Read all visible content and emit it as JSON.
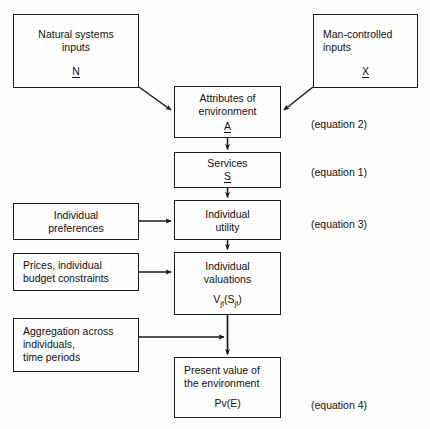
{
  "diagram": {
    "background_color": "#fdfdfd",
    "line_color": "#1a1a1a",
    "text_color": "#111111"
  },
  "boxes": {
    "natural_inputs": {
      "label": "Natural systems\ninputs",
      "symbol": "N",
      "x": 13,
      "y": 14,
      "w": 126,
      "h": 74
    },
    "man_inputs": {
      "label": "Man-controlled\ninputs",
      "symbol": "X",
      "x": 313,
      "y": 14,
      "w": 105,
      "h": 74
    },
    "attributes": {
      "label": "Attributes of\nenvironment",
      "symbol": "A",
      "x": 174,
      "y": 86,
      "w": 107,
      "h": 52
    },
    "services": {
      "label": "Services",
      "symbol": "S",
      "x": 174,
      "y": 152,
      "w": 107,
      "h": 36
    },
    "individual_preferences": {
      "label": "Individual\npreferences",
      "x": 13,
      "y": 203,
      "w": 126,
      "h": 37
    },
    "individual_utility": {
      "label": "Individual\nutility",
      "x": 174,
      "y": 200,
      "w": 107,
      "h": 40
    },
    "prices_constraints": {
      "label": "Prices, individual\nbudget constraints",
      "x": 13,
      "y": 253,
      "w": 126,
      "h": 38
    },
    "individual_valuations": {
      "label": "Individual\nvaluations",
      "formula": "V",
      "formula_sub1": "jt",
      "formula_mid": "(S",
      "formula_sub2": "jt",
      "formula_end": ")",
      "x": 174,
      "y": 252,
      "w": 107,
      "h": 63
    },
    "aggregation": {
      "label": "Aggregation across\nindividuals,\ntime periods",
      "x": 13,
      "y": 318,
      "w": 126,
      "h": 54
    },
    "present_value": {
      "label": "Present value of\nthe environment",
      "symbol_plain": "Pv(E)",
      "x": 174,
      "y": 357,
      "w": 107,
      "h": 61
    }
  },
  "equation_labels": [
    {
      "text": "(equation 2)",
      "x": 311,
      "y": 118
    },
    {
      "text": "(equation 1)",
      "x": 311,
      "y": 166
    },
    {
      "text": "(equation 3)",
      "x": 311,
      "y": 218
    },
    {
      "text": "(equation 4)",
      "x": 311,
      "y": 399
    }
  ]
}
